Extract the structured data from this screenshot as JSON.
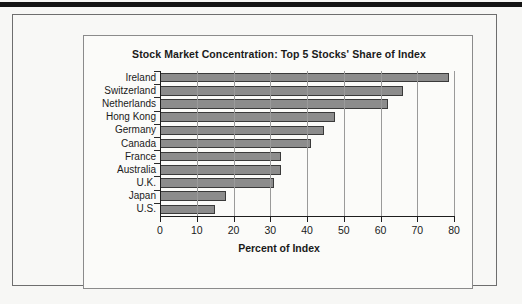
{
  "chart_data": {
    "type": "bar",
    "orientation": "horizontal",
    "title": "Stock Market Concentration: Top 5 Stocks' Share of Index",
    "xlabel": "Percent of Index",
    "ylabel": "",
    "xlim": [
      0,
      80
    ],
    "xticks": [
      0,
      10,
      20,
      30,
      40,
      50,
      60,
      70,
      80
    ],
    "xtick_labels": [
      "0",
      "10",
      "20",
      "30",
      "40",
      "50",
      "60",
      "70",
      "80"
    ],
    "grid": "vertical",
    "legend": "none",
    "categories": [
      "Ireland",
      "Switzerland",
      "Netherlands",
      "Hong Kong",
      "Germany",
      "Canada",
      "France",
      "Australia",
      "U.K.",
      "Japan",
      "U.S."
    ],
    "values": [
      78.6,
      66.0,
      62.0,
      47.5,
      44.5,
      41.0,
      33.0,
      32.8,
      31.0,
      18.0,
      15.0
    ],
    "bar_color": "#8c8c8c",
    "bar_edge_color": "#3a3a3a"
  },
  "colors": {
    "page_background": "#f7f7f5",
    "panel_background": "#fbfbf9",
    "frame_border": "#6e6e6e",
    "panel_border": "#8b8b8b",
    "axis": "#1e1e1e",
    "gridline": "#9a9a9a",
    "text": "#1a1a1a",
    "top_rule": "#141414"
  }
}
